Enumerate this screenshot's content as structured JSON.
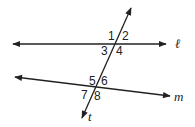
{
  "diagram": {
    "type": "parallel-lines-transversal",
    "lines": [
      {
        "name": "l",
        "label": "ℓ"
      },
      {
        "name": "m",
        "label": "m"
      },
      {
        "name": "t",
        "label": "t"
      }
    ],
    "angles": {
      "a1": "1",
      "a2": "2",
      "a3": "3",
      "a4": "4",
      "a5": "5",
      "a6": "6",
      "a7": "7",
      "a8": "8"
    },
    "colors": {
      "stroke": "#222222",
      "background": "#ffffff"
    }
  }
}
